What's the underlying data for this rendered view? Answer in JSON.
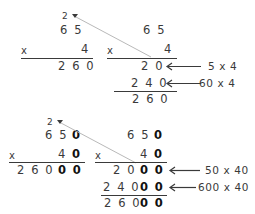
{
  "worksheet": {
    "title": "Multiplication partial products comparison",
    "background_color": "#ffffff",
    "ink_color": "#3a3a3a",
    "bold_ink_color": "#111111",
    "guide_line_color": "#b9b9b9"
  },
  "problems": [
    {
      "id": "problem-1",
      "standard": {
        "carry": "2",
        "multiplicand": "6 5",
        "operator": "x",
        "multiplier": "4",
        "product": "2 6 0"
      },
      "expanded": {
        "multiplicand": "6 5",
        "operator": "x",
        "multiplier": "4",
        "partials": [
          {
            "value": "2 0",
            "bold_suffix": "",
            "label": "5 x 4"
          },
          {
            "value": "2 4 0",
            "bold_suffix": "",
            "label": "60 x 4"
          }
        ],
        "total": "2 6 0",
        "total_bold_suffix": ""
      }
    },
    {
      "id": "problem-2",
      "standard": {
        "carry": "2",
        "multiplicand": "6 5",
        "multiplicand_bold": "0",
        "operator": "x",
        "multiplier": "4",
        "multiplier_bold": "0",
        "product": "2 6 0",
        "product_bold": "0 0"
      },
      "expanded": {
        "multiplicand": "6 5",
        "multiplicand_bold": "0",
        "operator": "x",
        "multiplier": "4",
        "multiplier_bold": "0",
        "partials": [
          {
            "value": "2 0",
            "bold_suffix": "0 0",
            "label": "50 x 40"
          },
          {
            "value": "2 4 0",
            "bold_suffix": "0 0",
            "label": "600 x 40"
          }
        ],
        "total": "2 6 0",
        "total_bold_suffix": "0 0"
      }
    }
  ]
}
